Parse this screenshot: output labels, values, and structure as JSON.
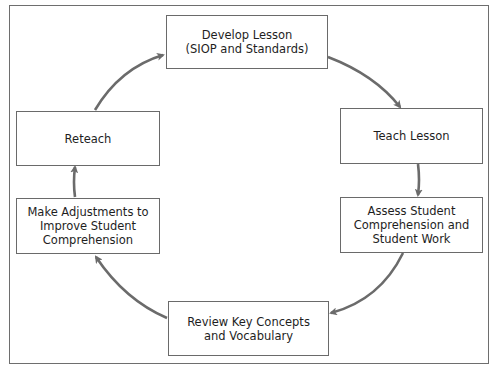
{
  "diagram": {
    "type": "cycle",
    "accent_color": "#6b6b6b",
    "nodes": [
      {
        "id": "develop",
        "label": "Develop Lesson\n(SIOP and Standards)"
      },
      {
        "id": "teach",
        "label": "Teach Lesson"
      },
      {
        "id": "assess",
        "label": "Assess Student\nComprehension and\nStudent Work"
      },
      {
        "id": "review",
        "label": "Review Key Concepts\nand Vocabulary"
      },
      {
        "id": "adjust",
        "label": "Make Adjustments to\nImprove Student\nComprehension"
      },
      {
        "id": "reteach",
        "label": "Reteach"
      }
    ],
    "edges": [
      {
        "from": "develop",
        "to": "teach"
      },
      {
        "from": "teach",
        "to": "assess"
      },
      {
        "from": "assess",
        "to": "review"
      },
      {
        "from": "review",
        "to": "adjust"
      },
      {
        "from": "adjust",
        "to": "reteach"
      },
      {
        "from": "reteach",
        "to": "develop"
      }
    ]
  }
}
